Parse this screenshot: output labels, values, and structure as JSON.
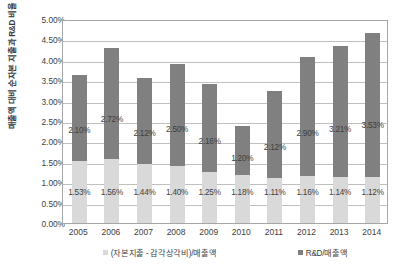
{
  "chart_data": {
    "type": "bar",
    "subtype": "stacked-column",
    "title": "",
    "xlabel": "",
    "ylabel": "매출액 대비 순자본 지출과 R&D 비율",
    "ylim": [
      0,
      5
    ],
    "ytick_labels": [
      "5.00%",
      "4.50%",
      "4.00%",
      "3.50%",
      "3.00%",
      "2.50%",
      "2.00%",
      "1.50%",
      "1.00%",
      "0.50%",
      "0.00%"
    ],
    "ytick_values": [
      5.0,
      4.5,
      4.0,
      3.5,
      3.0,
      2.5,
      2.0,
      1.5,
      1.0,
      0.5,
      0.0
    ],
    "grid": true,
    "legend_position": "bottom",
    "categories": [
      "2005",
      "2006",
      "2007",
      "2008",
      "2009",
      "2010",
      "2011",
      "2012",
      "2013",
      "2014"
    ],
    "series": [
      {
        "name": "(자본지출 - 감각상각비)/매출액",
        "color": "#d9d9d9",
        "values": [
          1.53,
          1.56,
          1.44,
          1.4,
          1.25,
          1.18,
          1.11,
          1.16,
          1.14,
          1.12
        ],
        "labels": [
          "1.53%",
          "1.56%",
          "1.44%",
          "1.40%",
          "1.25%",
          "1.18%",
          "1.11%",
          "1.16%",
          "1.14%",
          "1.12%"
        ]
      },
      {
        "name": "R&D/매출액",
        "color": "#808080",
        "values": [
          2.1,
          2.72,
          2.12,
          2.5,
          2.16,
          1.2,
          2.12,
          2.9,
          3.21,
          3.53
        ],
        "labels": [
          "2.10%",
          "2.72%",
          "2.12%",
          "2.50%",
          "2.16%",
          "1.20%",
          "2.12%",
          "2.90%",
          "3.21%",
          "3.53%"
        ]
      }
    ],
    "totals": [
      3.63,
      4.28,
      3.56,
      3.9,
      3.41,
      2.38,
      3.23,
      4.06,
      4.35,
      4.65
    ]
  },
  "colors": {
    "capex_bar": "#d9d9d9",
    "rnd_bar": "#808080",
    "gridline": "#bfbfbf",
    "axis": "#a6a6a6",
    "text": "#3f3f3f",
    "background": "#ffffff"
  }
}
